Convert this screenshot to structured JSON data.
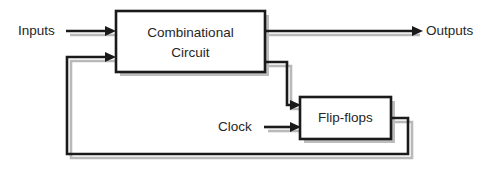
{
  "diagram": {
    "background_color": "#ffffff",
    "line_color": "#1a1a1a",
    "shadow_color": "#bdbdbd",
    "text_color": "#262626",
    "blocks": [
      {
        "id": "combinational-circuit",
        "label_line1": "Combinational",
        "label_line2": "Circuit",
        "x": 116,
        "y": 11,
        "width": 149,
        "height": 61
      },
      {
        "id": "flip-flops",
        "label_line1": "Flip-flops",
        "label_line2": "",
        "x": 300,
        "y": 97,
        "width": 91,
        "height": 42
      }
    ],
    "labels": [
      {
        "id": "inputs-label",
        "text": "Inputs",
        "x": 18,
        "y": 31
      },
      {
        "id": "outputs-label",
        "text": "Outputs",
        "x": 426,
        "y": 31
      },
      {
        "id": "clock-label",
        "text": "Clock",
        "x": 218,
        "y": 127
      }
    ],
    "wires": [
      {
        "id": "inputs-wire",
        "description": "Inputs into Combinational Circuit",
        "arrow": true
      },
      {
        "id": "outputs-wire",
        "description": "Combinational Circuit to Outputs",
        "arrow": true
      },
      {
        "id": "comb-to-ff-wire",
        "description": "Combinational Circuit to Flip-flops",
        "arrow": true
      },
      {
        "id": "clock-wire",
        "description": "Clock into Flip-flops",
        "arrow": true
      },
      {
        "id": "feedback-wire",
        "description": "Flip-flops state feedback to Combinational Circuit",
        "arrow": true
      }
    ]
  }
}
